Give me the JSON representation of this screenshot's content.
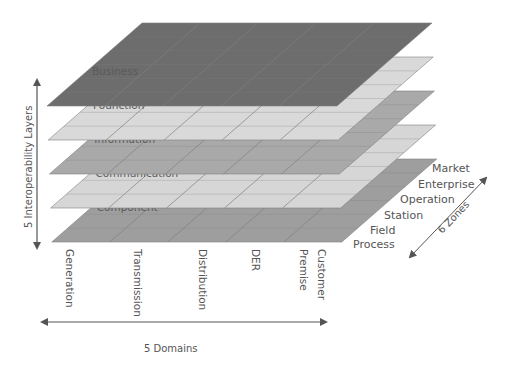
{
  "diagram": {
    "layers_axis_label": "5 Interoperability Layers",
    "domains_axis_label": "5  Domains",
    "zones_axis_label": "6 Zones",
    "layers": [
      {
        "name": "Business",
        "color": "#6d6d6d"
      },
      {
        "name": "Founction",
        "color": "#d9d9d9"
      },
      {
        "name": "Information",
        "color": "#a9a9a9"
      },
      {
        "name": "Communication",
        "color": "#d6d6d6"
      },
      {
        "name": "Component",
        "color": "#9e9e9e"
      }
    ],
    "domains": [
      "Generation",
      "Transmission",
      "Distribution",
      "DER",
      "Customer Premise"
    ],
    "domain_label_lines": [
      [
        "Generation"
      ],
      [
        "Transmission"
      ],
      [
        "Distribution"
      ],
      [
        "DER"
      ],
      [
        "Customer",
        "Premise"
      ]
    ],
    "zones": [
      "Market",
      "Enterprise",
      "Operation",
      "Station",
      "Field",
      "Process"
    ],
    "colors": {
      "grid_line": "#808080",
      "axis_arrow": "#555555",
      "text": "#555555"
    }
  }
}
